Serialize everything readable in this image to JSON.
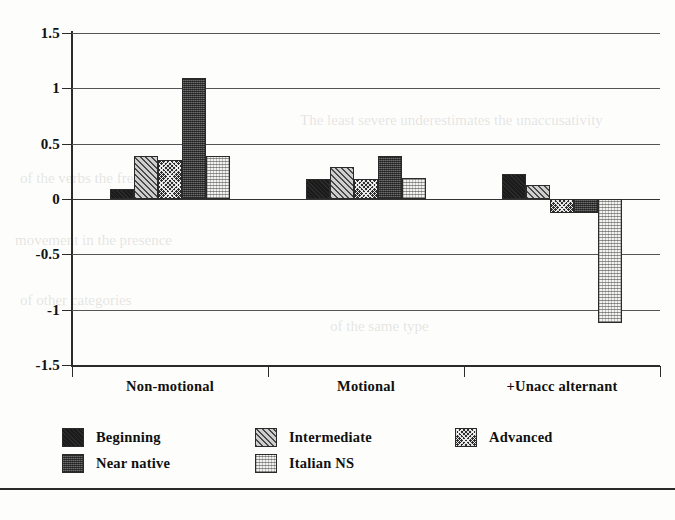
{
  "chart_data": {
    "type": "bar",
    "title": "",
    "xlabel": "",
    "ylabel": "",
    "ylim": [
      -1.5,
      1.5
    ],
    "ytick_labels": [
      "1.5",
      "1",
      "0.5",
      "0",
      "-0.5",
      "-1",
      "-1.5"
    ],
    "ytick_values": [
      1.5,
      1,
      0.5,
      0,
      -0.5,
      -1,
      -1.5
    ],
    "grid": true,
    "legend_position": "bottom",
    "categories": [
      "Non-motional",
      "Motional",
      "+Unacc alternant"
    ],
    "series": [
      {
        "name": "Beginning",
        "pattern": "solid-black",
        "values": [
          0.09,
          0.18,
          0.23
        ]
      },
      {
        "name": "Intermediate",
        "pattern": "diagonal-hatch",
        "values": [
          0.39,
          0.29,
          0.13
        ]
      },
      {
        "name": "Advanced",
        "pattern": "cross-check",
        "values": [
          0.35,
          0.18,
          -0.13
        ]
      },
      {
        "name": "Near native",
        "pattern": "dark-stipple",
        "values": [
          1.09,
          0.39,
          -0.13
        ]
      },
      {
        "name": "Italian NS",
        "pattern": "light-stipple",
        "values": [
          0.39,
          0.19,
          -1.12
        ]
      }
    ]
  },
  "legend": {
    "items": [
      {
        "label": "Beginning",
        "swatch": "swatch-beginning"
      },
      {
        "label": "Intermediate",
        "swatch": "swatch-intermediate"
      },
      {
        "label": "Advanced",
        "swatch": "swatch-advanced"
      },
      {
        "label": "Near native",
        "swatch": "swatch-near-native"
      },
      {
        "label": "Italian NS",
        "swatch": "swatch-italian-ns"
      }
    ]
  },
  "colors": {
    "axis": "#2b2b2b",
    "grid": "#555555",
    "text": "#101010",
    "background": "#fdfdfb"
  }
}
